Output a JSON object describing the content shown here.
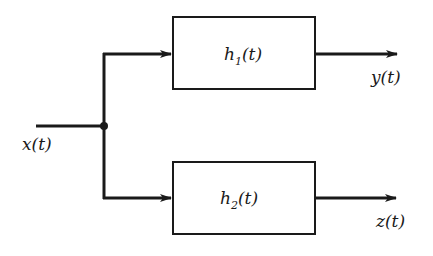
{
  "diagram": {
    "type": "block-diagram",
    "input": {
      "label": "x(t)"
    },
    "blocks": [
      {
        "id": "h1",
        "name": "h",
        "subscript": "1",
        "arg": "(t)",
        "output_label": "y(t)"
      },
      {
        "id": "h2",
        "name": "h",
        "subscript": "2",
        "arg": "(t)",
        "output_label": "z(t)"
      }
    ],
    "colors": {
      "stroke": "#1a1a1a",
      "background": "#ffffff"
    }
  }
}
